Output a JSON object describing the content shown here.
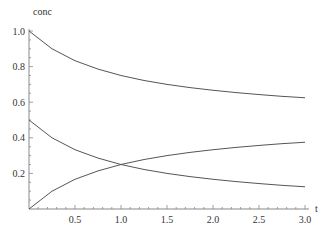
{
  "chart_data": {
    "type": "line",
    "title": "",
    "xlabel": "t",
    "ylabel": "conc",
    "xlim": [
      0,
      3.0
    ],
    "ylim": [
      0,
      1.0
    ],
    "grid": false,
    "legend": null,
    "x_ticks": [
      "0.5",
      "1.0",
      "1.5",
      "2.0",
      "2.5",
      "3.0"
    ],
    "y_ticks": [
      "0.2",
      "0.4",
      "0.6",
      "0.8",
      "1.0"
    ],
    "x": [
      0,
      0.25,
      0.5,
      0.75,
      1.0,
      1.25,
      1.5,
      1.75,
      2.0,
      2.25,
      2.5,
      2.75,
      3.0
    ],
    "series": [
      {
        "name": "upper decreasing",
        "values": [
          1.0,
          0.9,
          0.833,
          0.786,
          0.75,
          0.722,
          0.7,
          0.682,
          0.667,
          0.654,
          0.643,
          0.633,
          0.625
        ]
      },
      {
        "name": "lower decreasing",
        "values": [
          0.5,
          0.4,
          0.333,
          0.286,
          0.25,
          0.222,
          0.2,
          0.182,
          0.167,
          0.154,
          0.143,
          0.133,
          0.125
        ]
      },
      {
        "name": "increasing",
        "values": [
          0.0,
          0.1,
          0.167,
          0.214,
          0.25,
          0.278,
          0.3,
          0.318,
          0.333,
          0.346,
          0.357,
          0.367,
          0.375
        ]
      }
    ],
    "line_color": "#555555"
  }
}
